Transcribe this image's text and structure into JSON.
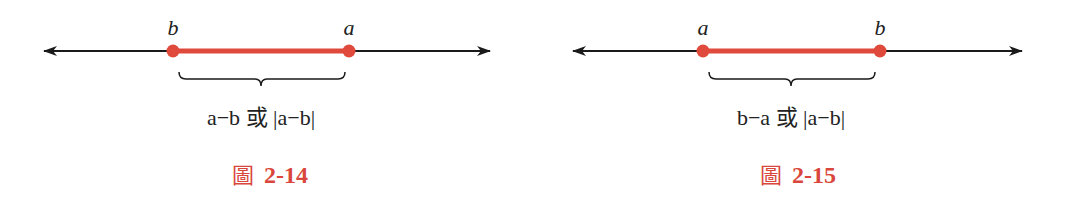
{
  "colors": {
    "line": "#1a1a1a",
    "segment": "#e04a3c",
    "caption": "#d9473c",
    "text": "#222222"
  },
  "figures": [
    {
      "left_label": "b",
      "right_label": "a",
      "expression": "a−b 或 |a−b|",
      "caption_prefix": "圖",
      "caption_number": "2-14"
    },
    {
      "left_label": "a",
      "right_label": "b",
      "expression": "b−a 或 |a−b|",
      "caption_prefix": "圖",
      "caption_number": "2-15"
    }
  ]
}
